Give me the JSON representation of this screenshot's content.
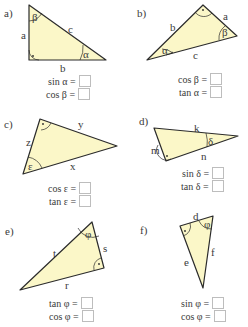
{
  "colors": {
    "fill": "#fbf7c8",
    "stroke": "#2b2b2b",
    "box_border": "#bdbdbd",
    "text": "#3a3a3a"
  },
  "exercises": [
    {
      "id": "a",
      "label": "a)",
      "sides": {
        "a": "a",
        "b": "b",
        "c": "c"
      },
      "angles": [
        "β",
        "α"
      ],
      "equations": [
        {
          "lhs": "sin α ="
        },
        {
          "lhs": "cos β ="
        }
      ]
    },
    {
      "id": "b",
      "label": "b)",
      "sides": {
        "a": "a",
        "b": "b",
        "c": "c"
      },
      "angles": [
        "α",
        "β"
      ],
      "equations": [
        {
          "lhs": "cos β ="
        },
        {
          "lhs": "tan α ="
        }
      ]
    },
    {
      "id": "c",
      "label": "c)",
      "sides": {
        "x": "x",
        "y": "y",
        "z": "z"
      },
      "angles": [
        "ε"
      ],
      "equations": [
        {
          "lhs": "cos ε ="
        },
        {
          "lhs": "tan ε ="
        }
      ]
    },
    {
      "id": "d",
      "label": "d)",
      "sides": {
        "k": "k",
        "m": "m",
        "n": "n"
      },
      "angles": [
        "δ"
      ],
      "equations": [
        {
          "lhs": "sin δ ="
        },
        {
          "lhs": "tan δ ="
        }
      ]
    },
    {
      "id": "e",
      "label": "e)",
      "sides": {
        "r": "r",
        "s": "s",
        "t": "t"
      },
      "angles": [
        "φ"
      ],
      "equations": [
        {
          "lhs": "tan φ ="
        },
        {
          "lhs": "cos φ ="
        }
      ]
    },
    {
      "id": "f",
      "label": "f)",
      "sides": {
        "d": "d",
        "e": "e",
        "f": "f"
      },
      "angles": [
        "φ"
      ],
      "equations": [
        {
          "lhs": "sin φ ="
        },
        {
          "lhs": "cos φ ="
        }
      ]
    }
  ]
}
